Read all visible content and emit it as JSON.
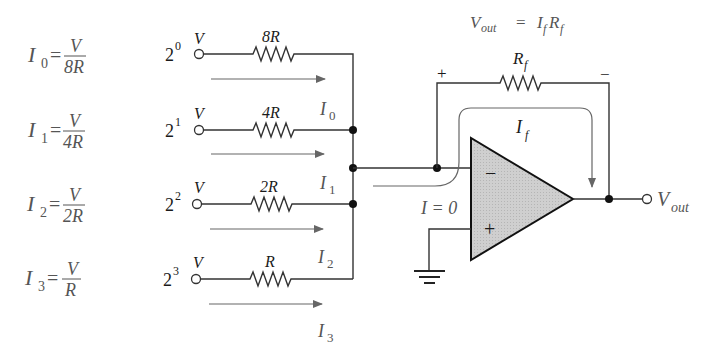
{
  "equations": [
    {
      "lhs": "I",
      "sub": "0",
      "num": "V",
      "den": "8R"
    },
    {
      "lhs": "I",
      "sub": "1",
      "num": "V",
      "den": "4R"
    },
    {
      "lhs": "I",
      "sub": "2",
      "num": "V",
      "den": "2R"
    },
    {
      "lhs": "I",
      "sub": "3",
      "num": "V",
      "den": "R"
    }
  ],
  "inputs": [
    {
      "weight_base": "2",
      "weight_exp": "0",
      "voltage": "V",
      "resistor": "8R",
      "current": "I",
      "current_sub": "0"
    },
    {
      "weight_base": "2",
      "weight_exp": "1",
      "voltage": "V",
      "resistor": "4R",
      "current": "I",
      "current_sub": "1"
    },
    {
      "weight_base": "2",
      "weight_exp": "2",
      "voltage": "V",
      "resistor": "2R",
      "current": "I",
      "current_sub": "2"
    },
    {
      "weight_base": "2",
      "weight_exp": "3",
      "voltage": "V",
      "resistor": "R",
      "current": "I",
      "current_sub": "3"
    }
  ],
  "feedback": {
    "formula_lhs": "V",
    "formula_lhs_sub": "out",
    "formula_eq": "=",
    "formula_rhs_1": "I",
    "formula_rhs_1_sub": "f",
    "formula_rhs_2": "R",
    "formula_rhs_2_sub": "f",
    "resistor_label": "R",
    "resistor_sub": "f",
    "plus_sign": "+",
    "minus_sign": "−",
    "current_label": "I",
    "current_sub": "f"
  },
  "opamp": {
    "inverting_sign": "−",
    "noninverting_sign": "+",
    "input_current_label": "I = 0"
  },
  "output": {
    "label": "V",
    "label_sub": "out"
  },
  "colors": {
    "opamp_fill": "#c8c8c8",
    "wire": "#333333",
    "arrow": "#666666",
    "label": "#555555"
  }
}
